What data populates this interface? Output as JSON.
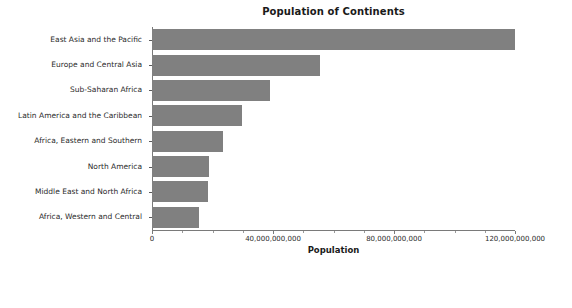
{
  "chart_data": {
    "type": "bar",
    "orientation": "horizontal",
    "title": "Population of Continents",
    "xlabel": "Population",
    "ylabel": "",
    "categories": [
      "East Asia and the Pacific",
      "Europe and Central Asia",
      "Sub-Saharan Africa",
      "Latin America and the Caribbean",
      "Africa, Eastern and Southern",
      "North America",
      "Middle East and North Africa",
      "Africa, Western and Central"
    ],
    "values": [
      120000000000,
      55500000000,
      39000000000,
      29800000000,
      23500000000,
      18800000000,
      18500000000,
      15500000000
    ],
    "xlim": [
      0,
      120000000000
    ],
    "xticks": [
      0,
      40000000000,
      80000000000,
      120000000000
    ],
    "xtick_labels": [
      "0",
      "40,000,000,000",
      "80,000,000,000",
      "120,000,000,000"
    ],
    "grid": false,
    "legend": null,
    "bar_color": "#808080"
  },
  "widgets": {
    "slider": {
      "label": "Select_Year",
      "fill_fraction": 0.61,
      "track_color": "#f2f2f2",
      "fill_color": "#4a4a4a",
      "handle_color": "#4a4a4a"
    }
  }
}
